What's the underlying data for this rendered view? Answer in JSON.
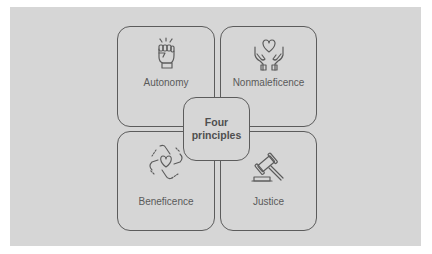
{
  "diagram": {
    "center": {
      "line1": "Four",
      "line2": "principles"
    },
    "quadrants": [
      {
        "label": "Autonomy",
        "icon": "raised-fist-icon"
      },
      {
        "label": "Nonmaleficence",
        "icon": "hands-holding-heart-icon"
      },
      {
        "label": "Beneficence",
        "icon": "joined-hands-heart-icon"
      },
      {
        "label": "Justice",
        "icon": "gavel-icon"
      }
    ]
  },
  "colors": {
    "background": "#d6d6d6",
    "stroke": "#5c5c5c",
    "text": "#5a5a5a",
    "page": "#ffffff"
  }
}
